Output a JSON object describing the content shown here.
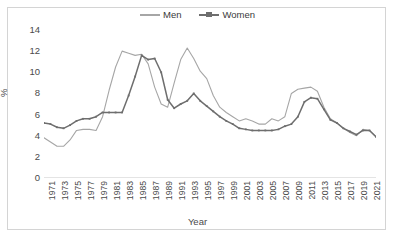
{
  "chart_data": {
    "type": "line",
    "title": "",
    "xlabel": "Year",
    "ylabel": "%",
    "legend_position": "top-center",
    "grid": false,
    "ylim": [
      0,
      14
    ],
    "yticks": [
      0,
      2,
      4,
      6,
      8,
      10,
      12,
      14
    ],
    "xlim": [
      1971,
      2022
    ],
    "xticks": [
      1971,
      1973,
      1975,
      1977,
      1979,
      1981,
      1983,
      1985,
      1987,
      1989,
      1991,
      1993,
      1995,
      1997,
      1999,
      2001,
      2003,
      2005,
      2007,
      2009,
      2011,
      2013,
      2015,
      2017,
      2019,
      2021
    ],
    "x": [
      1971,
      1972,
      1973,
      1974,
      1975,
      1976,
      1977,
      1978,
      1979,
      1980,
      1981,
      1982,
      1983,
      1984,
      1985,
      1986,
      1987,
      1988,
      1989,
      1990,
      1991,
      1992,
      1993,
      1994,
      1995,
      1996,
      1997,
      1998,
      1999,
      2000,
      2001,
      2002,
      2003,
      2004,
      2005,
      2006,
      2007,
      2008,
      2009,
      2010,
      2011,
      2012,
      2013,
      2014,
      2015,
      2016,
      2017,
      2018,
      2019,
      2020,
      2021,
      2022
    ],
    "series": [
      {
        "name": "Men",
        "color": "#a6a6a6",
        "marker": false,
        "values": [
          3.8,
          3.4,
          3.0,
          3.0,
          3.6,
          4.5,
          4.6,
          4.6,
          4.5,
          5.8,
          8.3,
          10.5,
          12.0,
          11.8,
          11.6,
          11.7,
          10.8,
          8.6,
          7.0,
          6.7,
          9.0,
          11.2,
          12.3,
          11.3,
          10.1,
          9.4,
          7.8,
          6.7,
          6.2,
          5.8,
          5.4,
          5.6,
          5.4,
          5.1,
          5.1,
          5.6,
          5.4,
          5.8,
          8.0,
          8.4,
          8.5,
          8.6,
          8.2,
          6.7,
          5.6,
          5.2,
          4.7,
          4.3,
          4.0,
          4.6,
          4.5,
          3.9
        ]
      },
      {
        "name": "Women",
        "color": "#6e6e6e",
        "marker": true,
        "values": [
          5.2,
          5.1,
          4.8,
          4.7,
          5.0,
          5.4,
          5.6,
          5.6,
          5.8,
          6.2,
          6.2,
          6.2,
          6.2,
          7.8,
          9.6,
          11.6,
          11.2,
          11.3,
          10.0,
          7.4,
          6.6,
          7.0,
          7.3,
          8.0,
          7.3,
          6.8,
          6.3,
          5.8,
          5.4,
          5.1,
          4.7,
          4.6,
          4.5,
          4.5,
          4.5,
          4.5,
          4.6,
          4.9,
          5.1,
          5.8,
          7.2,
          7.6,
          7.5,
          6.5,
          5.5,
          5.2,
          4.7,
          4.4,
          4.1,
          4.5,
          4.5,
          3.9
        ]
      }
    ]
  },
  "legend": {
    "entries": [
      {
        "label": "Men"
      },
      {
        "label": "Women"
      }
    ]
  },
  "axes": {
    "y_title": "%",
    "x_title": "Year"
  }
}
